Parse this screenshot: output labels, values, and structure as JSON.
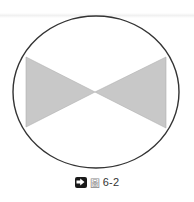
{
  "figure": {
    "caption": {
      "icon": "arrow-right-box-icon",
      "prefix": "圖",
      "number": "6-2"
    },
    "shapes": {
      "ellipse": {
        "cx": 96,
        "cy": 92,
        "rx": 83,
        "ry": 76,
        "stroke": "#333333",
        "fill": "#ffffff"
      },
      "left_triangle": {
        "points": "26,57 26,127 95,92",
        "fill": "#c8c8c8"
      },
      "right_triangle": {
        "points": "166,57 166,128 95,92",
        "fill": "#c8c8c8"
      }
    },
    "colors": {
      "outline": "#333333",
      "triangle_fill": "#c8c8c8",
      "triangle_stroke": "#b0b0b0",
      "background": "#ffffff"
    }
  }
}
